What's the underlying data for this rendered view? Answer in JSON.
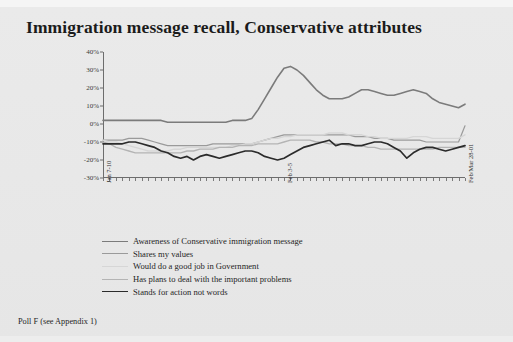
{
  "slide": {
    "title": "Immigration message recall, Conservative attributes",
    "footnote": "Poll F (see Appendix 1)",
    "background_color": "#e7e7e7"
  },
  "chart_data": {
    "type": "line",
    "title": "Immigration message recall, Conservative attributes",
    "xlabel": "",
    "ylabel": "",
    "ylim": [
      -30,
      40
    ],
    "yticks": [
      40,
      30,
      20,
      10,
      0,
      -10,
      -20,
      -30
    ],
    "ytick_labels": [
      "40%",
      "30%",
      "20%",
      "10%",
      "0%",
      "-10%",
      "-20%",
      "-30%"
    ],
    "grid": false,
    "legend_position": "bottom",
    "x_tick_count": 57,
    "x_labelled_ticks": [
      {
        "index": 0,
        "label": "Jan 7-10"
      },
      {
        "index": 28,
        "label": "Feb 3-5"
      },
      {
        "index": 56,
        "label": "Feb/Mar 28-01"
      }
    ],
    "xtick_labels": [
      "Jan 7-10",
      "Feb 3-5",
      "Feb/Mar 28-01"
    ],
    "series": [
      {
        "name": "Awareness of Conservative immigration message",
        "color": "#7b7b7b",
        "width": 1.6,
        "values": [
          2,
          2,
          2,
          2,
          2,
          2,
          2,
          2,
          2,
          2,
          1,
          1,
          1,
          1,
          1,
          1,
          1,
          1,
          1,
          1,
          2,
          2,
          2,
          3,
          8,
          14,
          20,
          26,
          31,
          32,
          30,
          27,
          23,
          19,
          16,
          14,
          14,
          14,
          15,
          17,
          19,
          19,
          18,
          17,
          16,
          16,
          17,
          18,
          19,
          18,
          17,
          14,
          12,
          11,
          10,
          9,
          11
        ]
      },
      {
        "name": "Shares my values",
        "color": "#9a9a9a",
        "width": 1.2,
        "values": [
          -9,
          -9,
          -9,
          -9,
          -8,
          -8,
          -8,
          -9,
          -10,
          -11,
          -12,
          -12,
          -12,
          -12,
          -12,
          -12,
          -12,
          -11,
          -11,
          -11,
          -11,
          -11,
          -11,
          -11,
          -10,
          -9,
          -8,
          -7,
          -6,
          -6,
          -6,
          -6,
          -6,
          -6,
          -6,
          -6,
          -6,
          -6,
          -6,
          -7,
          -7,
          -7,
          -8,
          -8,
          -8,
          -9,
          -9,
          -9,
          -9,
          -9,
          -10,
          -10,
          -10,
          -10,
          -10,
          -10,
          -1
        ]
      },
      {
        "name": "Would do a good job in Government",
        "color": "#d6d6d6",
        "width": 1.4,
        "values": [
          -9,
          -10,
          -10,
          -11,
          -12,
          -13,
          -14,
          -15,
          -15,
          -15,
          -15,
          -14,
          -14,
          -13,
          -13,
          -13,
          -13,
          -13,
          -13,
          -13,
          -12,
          -12,
          -11,
          -11,
          -10,
          -9,
          -8,
          -8,
          -7,
          -7,
          -6,
          -6,
          -6,
          -6,
          -6,
          -5,
          -5,
          -5,
          -6,
          -6,
          -6,
          -7,
          -7,
          -8,
          -8,
          -8,
          -8,
          -8,
          -7,
          -7,
          -7,
          -8,
          -8,
          -8,
          -8,
          -8,
          -6
        ]
      },
      {
        "name": "Has plans to deal with the important problems",
        "color": "#b4b4b4",
        "width": 1.3,
        "values": [
          -10,
          -11,
          -13,
          -14,
          -15,
          -16,
          -16,
          -16,
          -16,
          -16,
          -16,
          -16,
          -16,
          -15,
          -15,
          -14,
          -14,
          -14,
          -13,
          -13,
          -13,
          -12,
          -12,
          -12,
          -11,
          -11,
          -11,
          -11,
          -10,
          -9,
          -9,
          -9,
          -9,
          -10,
          -10,
          -11,
          -11,
          -11,
          -12,
          -12,
          -12,
          -13,
          -13,
          -14,
          -14,
          -14,
          -14,
          -14,
          -14,
          -14,
          -14,
          -14,
          -13,
          -13,
          -13,
          -13,
          -13
        ]
      },
      {
        "name": "Stands for action not words",
        "color": "#2b2b2b",
        "width": 1.7,
        "values": [
          -11,
          -11,
          -11,
          -11,
          -10,
          -10,
          -11,
          -12,
          -13,
          -15,
          -16,
          -18,
          -19,
          -18,
          -20,
          -18,
          -17,
          -18,
          -19,
          -18,
          -17,
          -16,
          -15,
          -15,
          -16,
          -18,
          -19,
          -20,
          -19,
          -17,
          -15,
          -13,
          -12,
          -11,
          -10,
          -9,
          -12,
          -11,
          -11,
          -12,
          -12,
          -11,
          -10,
          -10,
          -11,
          -13,
          -15,
          -19,
          -16,
          -14,
          -13,
          -13,
          -14,
          -15,
          -14,
          -13,
          -12
        ]
      }
    ],
    "legend": [
      {
        "label": "Awareness of Conservative immigration message",
        "color": "#7b7b7b"
      },
      {
        "label": "Shares my values",
        "color": "#9a9a9a"
      },
      {
        "label": "Would do a good job in Government",
        "color": "#d6d6d6"
      },
      {
        "label": "Has plans to deal with the important problems",
        "color": "#b4b4b4"
      },
      {
        "label": "Stands for action not words",
        "color": "#2b2b2b"
      }
    ]
  }
}
